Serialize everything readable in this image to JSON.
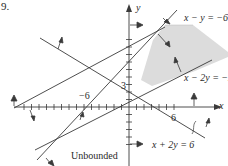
{
  "problem_number": "9.",
  "axes": {
    "x_label": "x",
    "y_label": "y"
  },
  "tick_labels": {
    "neg_x": "−6",
    "pos_x": "6",
    "pos_y": "3"
  },
  "lines": [
    {
      "id": "line-x-minus-y",
      "label": "x − y = −6"
    },
    {
      "id": "line-x-minus-2y",
      "label": "x − 2y = −2"
    },
    {
      "id": "line-x-plus-2y",
      "label": "x + 2y = 6"
    }
  ],
  "region_label": "Unbounded",
  "colors": {
    "shade": "#d9d9d9",
    "line": "#3a3a3a"
  }
}
